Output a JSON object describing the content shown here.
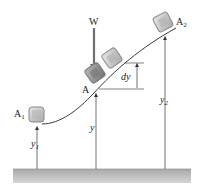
{
  "diagram": {
    "labels": {
      "weight": "W",
      "point_a": "A",
      "point_a1": "A",
      "point_a1_sub": "1",
      "point_a2": "A",
      "point_a2_sub": "2",
      "dy": "dy",
      "y": "y",
      "y1": "y",
      "y1_sub": "1",
      "y2": "y",
      "y2_sub": "2"
    },
    "colors": {
      "block_fill": "#b8b8b8",
      "block_border": "#8a8a8a",
      "block_a_fill": "#8c8c8c",
      "curve": "#3a3a3a",
      "ground": "#b5b5b5",
      "arrow": "#333333",
      "weight_arrow": "#6e6e6e"
    }
  }
}
